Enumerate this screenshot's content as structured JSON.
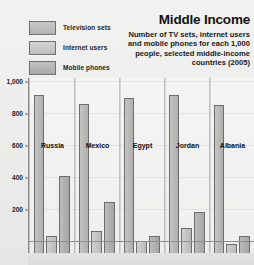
{
  "header": {
    "title": "Middle Income",
    "subtitle": "Number of TV sets, internet users and mobile phones for each 1,000 people, selected middle-income countries (2005)"
  },
  "legend": {
    "position": "top-left",
    "items": [
      {
        "label": "Television sets",
        "icon": "legend-swatch-icon",
        "color": "#bcbcba"
      },
      {
        "label": "Internet users",
        "icon": "legend-swatch-icon",
        "color": "#c6c6c4"
      },
      {
        "label": "Mobile phones",
        "icon": "legend-swatch-icon",
        "color": "#b2b2b0"
      }
    ]
  },
  "axis": {
    "y_ticks": [
      "1,000",
      "800",
      "600",
      "400",
      "200"
    ]
  },
  "countries": [
    {
      "name": "Russia"
    },
    {
      "name": "Mexico"
    },
    {
      "name": "Egypt"
    },
    {
      "name": "Jordan"
    },
    {
      "name": "Albania"
    }
  ],
  "chart_data": {
    "type": "bar",
    "title": "Middle Income",
    "subtitle": "Number of TV sets, internet users and mobile phones for each 1,000 people, selected middle-income countries (2005)",
    "xlabel": "",
    "ylabel": "",
    "ylim": [
      0,
      1000
    ],
    "yticks": [
      200,
      400,
      600,
      800,
      1000
    ],
    "grid": true,
    "legend_position": "top-left",
    "categories": [
      "Russia",
      "Mexico",
      "Egypt",
      "Jordan",
      "Albania"
    ],
    "series": [
      {
        "name": "Television sets",
        "color": "#bcbcba",
        "values": [
          970,
          910,
          950,
          970,
          905
        ]
      },
      {
        "name": "Internet users",
        "color": "#c6c6c4",
        "values": [
          90,
          120,
          55,
          135,
          35
        ]
      },
      {
        "name": "Mobile phones",
        "color": "#b2b2b0",
        "values": [
          460,
          300,
          85,
          240,
          90
        ]
      }
    ]
  }
}
